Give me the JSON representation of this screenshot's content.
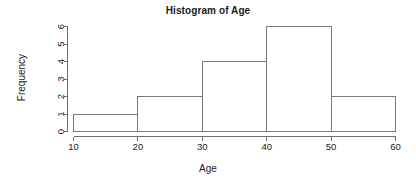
{
  "chart_data": {
    "type": "bar",
    "title": "Histogram of Age",
    "xlabel": "Age",
    "ylabel": "Frequency",
    "categories": [
      "10-20",
      "20-30",
      "30-40",
      "40-50",
      "50-60"
    ],
    "bin_edges": [
      10,
      20,
      30,
      40,
      50,
      60
    ],
    "values": [
      1,
      2,
      4,
      6,
      2
    ],
    "xlim": [
      10,
      60
    ],
    "ylim": [
      0,
      6
    ],
    "xticks": [
      "10",
      "20",
      "30",
      "40",
      "50",
      "60"
    ],
    "xtick_values": [
      10,
      20,
      30,
      40,
      50,
      60
    ],
    "yticks": [
      "0",
      "1",
      "2",
      "3",
      "4",
      "5",
      "6"
    ],
    "ytick_values": [
      0,
      1,
      2,
      3,
      4,
      5,
      6
    ],
    "grid": false,
    "legend": false,
    "bar_fill_color": "#ffffff",
    "bar_border_color": "#7a7a7a",
    "axis_color": "#6e6e6e",
    "background_color": "#ffffff",
    "text_color": "#1a1a1a",
    "ytick_label_rotation": -90
  }
}
